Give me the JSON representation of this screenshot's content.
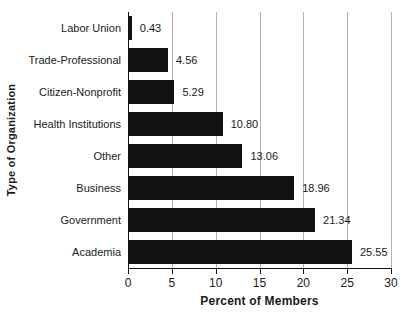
{
  "chart_data": {
    "type": "bar",
    "orientation": "horizontal",
    "categories": [
      "Labor Union",
      "Trade-Professional",
      "Citizen-Nonprofit",
      "Health Institutions",
      "Other",
      "Business",
      "Government",
      "Academia"
    ],
    "values": [
      0.43,
      4.56,
      5.29,
      10.8,
      13.06,
      18.96,
      21.34,
      25.55
    ],
    "value_labels": [
      "0.43",
      "4.56",
      "5.29",
      "10.80",
      "13.06",
      "18.96",
      "21.34",
      "25.55"
    ],
    "xlabel": "Percent of Members",
    "ylabel": "Type of Organization",
    "xlim": [
      0,
      30
    ],
    "xticks": [
      "0",
      "5",
      "10",
      "15",
      "20",
      "25",
      "30"
    ],
    "grid": "vertical-gridlines",
    "legend": "none",
    "colors": {
      "bar": "#111111",
      "gridline": "#b3b3b3",
      "axis": "#111111",
      "text": "#1a1a1a",
      "background": "#ffffff"
    }
  }
}
